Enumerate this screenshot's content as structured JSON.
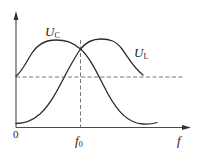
{
  "diagram": {
    "colors": {
      "background": "#ffffff",
      "curve": "#2b2b2b",
      "axis": "#4a4a4a",
      "dashed": "#555555"
    },
    "axes": {
      "origin_label": "0",
      "x_label": "f",
      "x_marker_label": "f",
      "x_marker_subscript": "0"
    },
    "curves": [
      {
        "name": "U_C",
        "label_main": "U",
        "label_sub": "C"
      },
      {
        "name": "U_L",
        "label_main": "U",
        "label_sub": "L"
      }
    ],
    "reference_lines": {
      "horizontal": "dashed level line (U at f = 0 for U_C)",
      "vertical": "dashed line at f0 (intersection of U_C and U_L)"
    }
  }
}
